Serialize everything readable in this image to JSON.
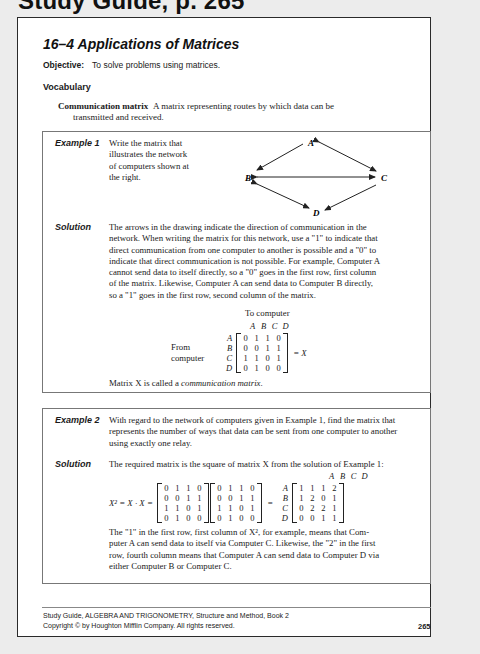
{
  "header": {
    "cut_heading": "Study Guide, p. 265"
  },
  "lesson": {
    "title": "16–4  Applications of Matrices",
    "objective_label": "Objective:",
    "objective_text": "To solve problems using matrices.",
    "vocabulary_heading": "Vocabulary",
    "vocab_term": "Communication matrix",
    "vocab_def_line1": "A matrix representing routes by which data can be",
    "vocab_def_line2": "transmitted and received."
  },
  "example1": {
    "label": "Example 1",
    "prompt_lines": [
      "Write the matrix that",
      "illustrates the network",
      "of computers shown at",
      "the right."
    ],
    "diagram": {
      "nodes": [
        "A",
        "B",
        "C",
        "D"
      ],
      "edges": [
        {
          "from": "A",
          "to": "B",
          "direction": "one-way"
        },
        {
          "from": "A",
          "to": "C",
          "direction": "two-way"
        },
        {
          "from": "B",
          "to": "C",
          "direction": "two-way"
        },
        {
          "from": "B",
          "to": "D",
          "direction": "two-way"
        },
        {
          "from": "C",
          "to": "D",
          "direction": "one-way"
        }
      ]
    },
    "solution_label": "Solution",
    "solution_lines": [
      "The arrows in the drawing indicate the direction of communication in the",
      "network. When writing the matrix for this network, use a \"1\" to indicate that",
      "direct communication from one computer to another is possible and a \"0\" to",
      "indicate that direct communication is not possible. For example, Computer A",
      "cannot send data to itself directly, so a \"0\" goes in the first row, first column",
      "of the matrix. Likewise, Computer A can send data to Computer B directly,",
      "so a \"1\" goes in the first row, second column of the matrix."
    ],
    "to_computer_label": "To computer",
    "from_label_1": "From",
    "from_label_2": "computer",
    "labels": [
      "A",
      "B",
      "C",
      "D"
    ],
    "matrix_X": [
      [
        0,
        1,
        1,
        0
      ],
      [
        0,
        0,
        1,
        1
      ],
      [
        1,
        1,
        0,
        1
      ],
      [
        0,
        1,
        0,
        0
      ]
    ],
    "equals_X": "= X",
    "closing_prefix": "Matrix X is called a ",
    "closing_term": "communication matrix",
    "closing_suffix": "."
  },
  "example2": {
    "label": "Example 2",
    "prompt_lines": [
      "With regard to the network of computers given in Example 1, find the matrix that",
      "represents the number of ways that data can be sent from one computer to another",
      "using exactly one relay."
    ],
    "solution_label": "Solution",
    "solution_intro": "The required matrix is the square of matrix X from the solution of Example 1:",
    "equation_lhs": "X² = X · X =",
    "equals": "=",
    "matrix_X": [
      [
        0,
        1,
        1,
        0
      ],
      [
        0,
        0,
        1,
        1
      ],
      [
        1,
        1,
        0,
        1
      ],
      [
        0,
        1,
        0,
        0
      ]
    ],
    "labels": [
      "A",
      "B",
      "C",
      "D"
    ],
    "matrix_X2": [
      [
        1,
        1,
        1,
        2
      ],
      [
        1,
        2,
        0,
        1
      ],
      [
        0,
        2,
        2,
        1
      ],
      [
        0,
        0,
        1,
        1
      ]
    ],
    "explanation_lines": [
      "The \"1\" in the first row, first column of X², for example, means that Com-",
      "puter A can send data to itself via Computer C. Likewise, the \"2\" in the first",
      "row, fourth column means that Computer A can send data to Computer D via",
      "either Computer B or Computer C."
    ]
  },
  "footer": {
    "line1": "Study Guide, ALGEBRA AND TRIGONOMETRY, Structure and Method, Book 2",
    "line2": "Copyright © by Houghton Mifflin Company. All rights reserved.",
    "page_number": "265"
  }
}
